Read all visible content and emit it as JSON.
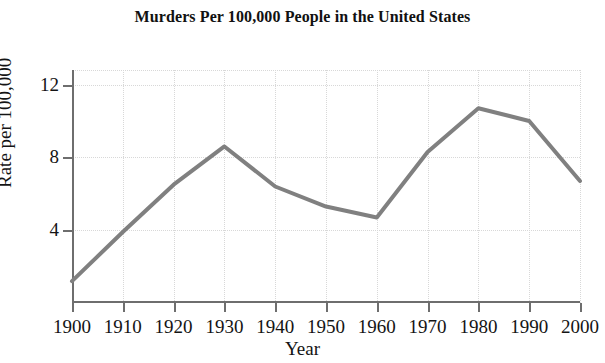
{
  "chart_data": {
    "type": "line",
    "title": "Murders Per 100,000 People in the United States",
    "xlabel": "Year",
    "ylabel": "Rate per 100,000",
    "x": [
      1900,
      1910,
      1920,
      1930,
      1940,
      1950,
      1960,
      1970,
      1980,
      1990,
      2000
    ],
    "values": [
      1.2,
      3.9,
      6.5,
      8.6,
      6.4,
      5.3,
      4.7,
      8.3,
      10.7,
      10.0,
      6.7
    ],
    "series": [
      {
        "name": "Murder rate per 100,000",
        "values": [
          1.2,
          3.9,
          6.5,
          8.6,
          6.4,
          5.3,
          4.7,
          8.3,
          10.7,
          10.0,
          6.7
        ]
      }
    ],
    "xlim": [
      1900,
      2000
    ],
    "ylim": [
      0,
      12.8
    ],
    "xticks": [
      1900,
      1910,
      1920,
      1930,
      1940,
      1950,
      1960,
      1970,
      1980,
      1990,
      2000
    ],
    "xtick_labels": [
      "1900",
      "1910",
      "1920",
      "1930",
      "1940",
      "1950",
      "1960",
      "1970",
      "1980",
      "1990",
      "2000"
    ],
    "yticks": [
      4,
      8,
      12
    ],
    "ytick_labels": [
      "4",
      "8",
      "12"
    ],
    "grid": true,
    "legend": false,
    "line_color": "#808080",
    "line_width": 4,
    "axis_color": "#6e6e6e",
    "grid_color": "#d8d8d8",
    "background": "#ffffff"
  }
}
